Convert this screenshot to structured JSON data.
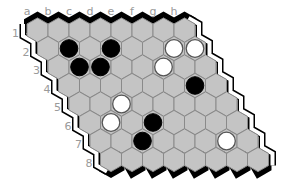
{
  "game": "Hex",
  "board": {
    "size": 8,
    "columns": [
      "a",
      "b",
      "c",
      "d",
      "e",
      "f",
      "g",
      "h"
    ],
    "rows": [
      "1",
      "2",
      "3",
      "4",
      "5",
      "6",
      "7",
      "8"
    ],
    "colors": {
      "cell_fill": "#c4c4c4",
      "cell_stroke": "#8a8a8a",
      "black_edge": "#000000",
      "white_edge_outline": "#000000",
      "black_stone": "#000000",
      "white_stone": "#ffffff",
      "label": "#9a9a9a"
    }
  },
  "stones": [
    {
      "cell": "b2",
      "color": "black"
    },
    {
      "cell": "d2",
      "color": "black"
    },
    {
      "cell": "b3",
      "color": "black"
    },
    {
      "cell": "c3",
      "color": "black"
    },
    {
      "cell": "g2",
      "color": "white"
    },
    {
      "cell": "h2",
      "color": "white"
    },
    {
      "cell": "f3",
      "color": "white"
    },
    {
      "cell": "g4",
      "color": "black"
    },
    {
      "cell": "c5",
      "color": "white"
    },
    {
      "cell": "b6",
      "color": "white"
    },
    {
      "cell": "d6",
      "color": "black"
    },
    {
      "cell": "c7",
      "color": "black"
    },
    {
      "cell": "g7",
      "color": "white"
    }
  ]
}
